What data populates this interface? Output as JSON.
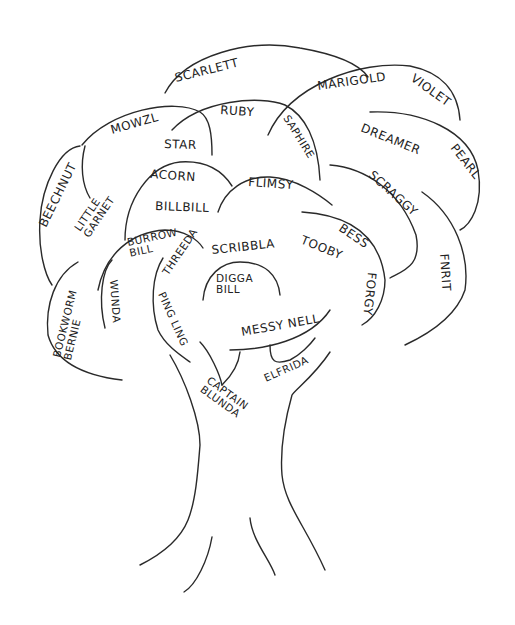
{
  "diagram": {
    "title": "",
    "type": "family-tree-drawing",
    "stroke_color": "#2a2a2a",
    "background": "#ffffff",
    "labels": [
      {
        "id": "scarlett",
        "text": "SCARLETT",
        "x": 176,
        "y": 82,
        "rot": -14,
        "size": "md"
      },
      {
        "id": "ruby",
        "text": "RUBY",
        "x": 220,
        "y": 114,
        "rot": 4,
        "size": "md"
      },
      {
        "id": "marigold",
        "text": "MARIGOLD",
        "x": 318,
        "y": 90,
        "rot": -8,
        "size": "md"
      },
      {
        "id": "violet",
        "text": "VIOLET",
        "x": 410,
        "y": 80,
        "rot": 36,
        "size": "md"
      },
      {
        "id": "mowzl",
        "text": "MOWZL",
        "x": 112,
        "y": 134,
        "rot": -16,
        "size": "md"
      },
      {
        "id": "star",
        "text": "STAR",
        "x": 164,
        "y": 148,
        "rot": 2,
        "size": "md"
      },
      {
        "id": "saphire",
        "text": "SAPHIRE",
        "x": 283,
        "y": 118,
        "rot": 58,
        "size": "sm"
      },
      {
        "id": "dreamer",
        "text": "DREAMER",
        "x": 360,
        "y": 131,
        "rot": 22,
        "size": "md"
      },
      {
        "id": "pearl",
        "text": "PEARL",
        "x": 450,
        "y": 148,
        "rot": 52,
        "size": "md"
      },
      {
        "id": "beechnut",
        "text": "BEECHNUT",
        "x": 46,
        "y": 228,
        "rot": -64,
        "size": "md"
      },
      {
        "id": "little-garnet",
        "text": "LITTLE\nGARNET",
        "x": 80,
        "y": 232,
        "rot": -56,
        "size": "sm"
      },
      {
        "id": "acorn",
        "text": "ACORN",
        "x": 150,
        "y": 178,
        "rot": 4,
        "size": "md"
      },
      {
        "id": "bill-bill",
        "text": "BILLBILL",
        "x": 155,
        "y": 210,
        "rot": 2,
        "size": "md"
      },
      {
        "id": "flimsy",
        "text": "FLIMSY",
        "x": 248,
        "y": 186,
        "rot": 4,
        "size": "md"
      },
      {
        "id": "scraggy",
        "text": "SCRAGGY",
        "x": 368,
        "y": 176,
        "rot": 42,
        "size": "md"
      },
      {
        "id": "burrow-bill",
        "text": "BURROW\nBILL",
        "x": 128,
        "y": 246,
        "rot": -12,
        "size": "sm"
      },
      {
        "id": "threeda",
        "text": "THREEDA",
        "x": 168,
        "y": 276,
        "rot": -56,
        "size": "sm"
      },
      {
        "id": "scribbla",
        "text": "SCRIBBLA",
        "x": 212,
        "y": 254,
        "rot": -6,
        "size": "md"
      },
      {
        "id": "bess",
        "text": "BESS",
        "x": 338,
        "y": 230,
        "rot": 34,
        "size": "md"
      },
      {
        "id": "tooby",
        "text": "TOOBY",
        "x": 300,
        "y": 243,
        "rot": 22,
        "size": "md"
      },
      {
        "id": "digga-bill",
        "text": "DIGGA\nBILL",
        "x": 216,
        "y": 282,
        "rot": 0,
        "size": "sm"
      },
      {
        "id": "wunda",
        "text": "WUNDA",
        "x": 110,
        "y": 280,
        "rot": 86,
        "size": "sm"
      },
      {
        "id": "bookworm-bernie",
        "text": "BOOKWORM\nBERNIE",
        "x": 60,
        "y": 358,
        "rot": -76,
        "size": "sm"
      },
      {
        "id": "ping-ling",
        "text": "PING LING",
        "x": 158,
        "y": 294,
        "rot": 66,
        "size": "sm"
      },
      {
        "id": "fnrit",
        "text": "FNRIT",
        "x": 440,
        "y": 254,
        "rot": 86,
        "size": "md"
      },
      {
        "id": "forgy",
        "text": "FORGY",
        "x": 368,
        "y": 272,
        "rot": 96,
        "size": "md"
      },
      {
        "id": "messy-nell",
        "text": "MESSY NELL",
        "x": 242,
        "y": 336,
        "rot": -10,
        "size": "md"
      },
      {
        "id": "elfrida",
        "text": "ELFRIDA",
        "x": 266,
        "y": 382,
        "rot": -24,
        "size": "sm"
      },
      {
        "id": "captain-blunda",
        "text": "CAPTAIN\nBLUNDA",
        "x": 206,
        "y": 382,
        "rot": 36,
        "size": "sm"
      }
    ]
  }
}
